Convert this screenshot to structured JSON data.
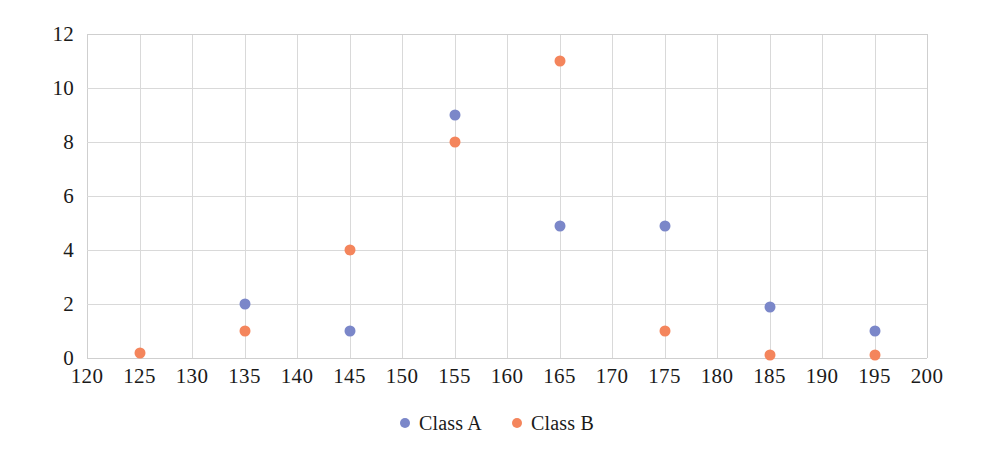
{
  "chart_data": {
    "type": "scatter",
    "title": "",
    "xlabel": "",
    "ylabel": "",
    "xlim": [
      120,
      200
    ],
    "ylim": [
      0,
      12
    ],
    "xticks": [
      120,
      125,
      130,
      135,
      140,
      145,
      150,
      155,
      160,
      165,
      170,
      175,
      180,
      185,
      190,
      195,
      200
    ],
    "yticks": [
      0,
      2,
      4,
      6,
      8,
      10,
      12
    ],
    "xtick_labels": [
      "120",
      "125",
      "130",
      "135",
      "140",
      "145",
      "150",
      "155",
      "160",
      "165",
      "170",
      "175",
      "180",
      "185",
      "190",
      "195",
      "200"
    ],
    "ytick_labels": [
      "0",
      "2",
      "4",
      "6",
      "8",
      "10",
      "12"
    ],
    "grid": true,
    "grid_color": "#d9d9d9",
    "legend_position": "bottom-center",
    "series": [
      {
        "name": "Class A",
        "color": "#7b87c9",
        "points": [
          {
            "x": 135,
            "y": 2
          },
          {
            "x": 145,
            "y": 1
          },
          {
            "x": 155,
            "y": 9
          },
          {
            "x": 165,
            "y": 4.9
          },
          {
            "x": 175,
            "y": 4.9
          },
          {
            "x": 185,
            "y": 1.9
          },
          {
            "x": 195,
            "y": 1
          }
        ]
      },
      {
        "name": "Class B",
        "color": "#f4855c",
        "points": [
          {
            "x": 125,
            "y": 0.2
          },
          {
            "x": 135,
            "y": 1
          },
          {
            "x": 145,
            "y": 4
          },
          {
            "x": 155,
            "y": 8
          },
          {
            "x": 165,
            "y": 11
          },
          {
            "x": 175,
            "y": 1
          },
          {
            "x": 185,
            "y": 0.1
          },
          {
            "x": 195,
            "y": 0.1
          }
        ]
      }
    ]
  },
  "legend": {
    "items": [
      {
        "label": "Class A",
        "color": "#7b87c9"
      },
      {
        "label": "Class B",
        "color": "#f4855c"
      }
    ]
  }
}
